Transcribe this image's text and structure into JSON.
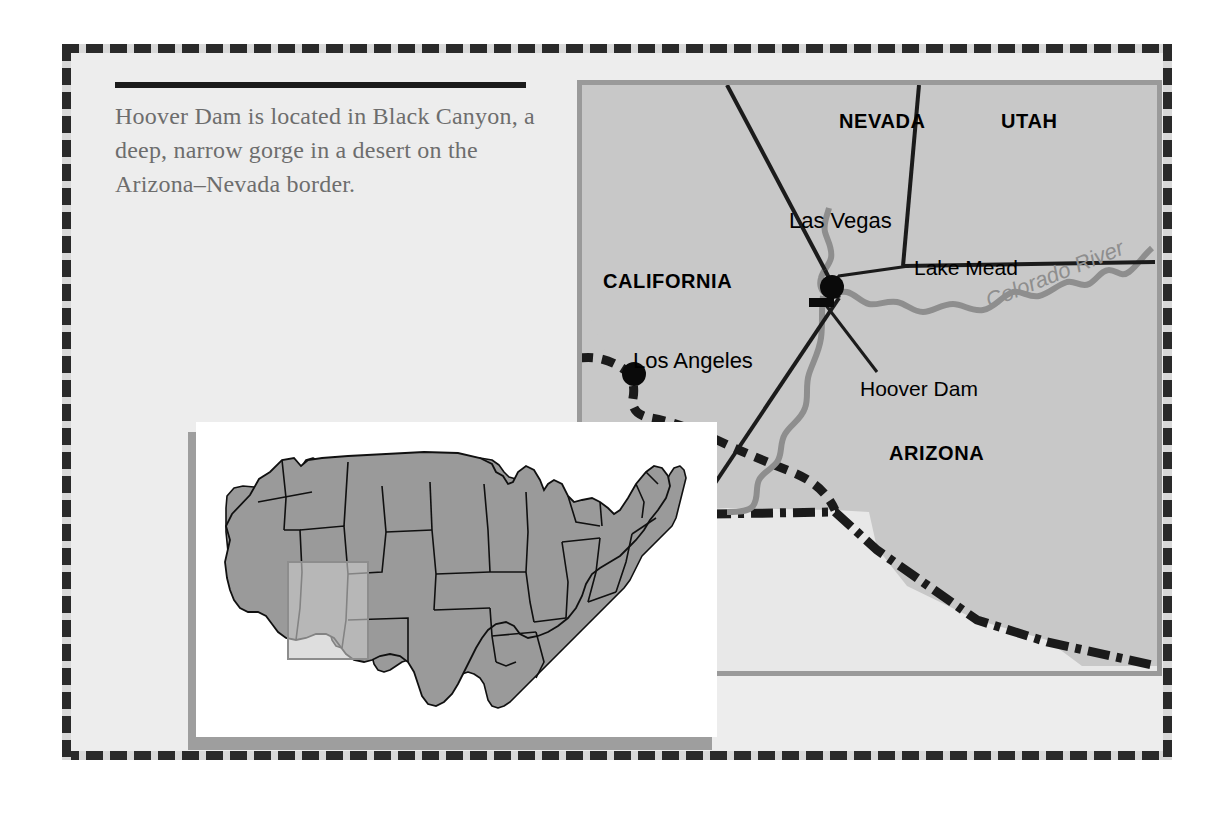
{
  "figure": {
    "caption": "Hoover Dam is located in Black Canyon, a deep, narrow gorge in a desert on the Arizona–Nevada border."
  },
  "colors": {
    "panel_background": "#ededed",
    "map_fill": "#c8c8c8",
    "outside_fill": "#e8e8e8",
    "border_line": "#1b1b1b",
    "river": "#8e8e8e",
    "inset_state_fill": "#9a9a9a",
    "inset_highlight": "#c9c9c9",
    "frame_gray": "#9a9a9a",
    "caption_text": "#6d6d6d"
  },
  "map": {
    "states": [
      {
        "name": "NEVADA",
        "x": 262,
        "y": 40
      },
      {
        "name": "UTAH",
        "x": 424,
        "y": 40
      },
      {
        "name": "CALIFORNIA",
        "x": 26,
        "y": 195
      },
      {
        "name": "ARIZONA",
        "x": 310,
        "y": 366
      }
    ],
    "cities": [
      {
        "name": "Las Vegas",
        "label_x": 228,
        "label_y": 132,
        "dot_x": 255,
        "dot_y": 207,
        "dot_r": 11
      },
      {
        "name": "Los Angeles",
        "label_x": 73,
        "label_y": 276,
        "dot_x": 57,
        "dot_y": 294,
        "dot_r": 11
      }
    ],
    "features": [
      {
        "name": "Lake Mead",
        "label_x": 337,
        "label_y": 179
      },
      {
        "name": "Hoover Dam",
        "label_x": 283,
        "label_y": 305
      },
      {
        "name": "Colorado River",
        "label_x": 420,
        "label_y": 232
      }
    ],
    "dam_marker": {
      "x": 240,
      "y": 221,
      "width": 23,
      "height": 8
    }
  },
  "inset": {
    "title": "United States locator map",
    "highlight_region": "California – Nevada – Arizona"
  }
}
